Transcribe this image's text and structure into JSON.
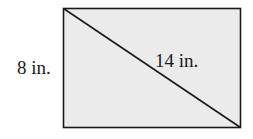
{
  "diagram": {
    "shape": "rectangle",
    "fill_color": "#ebebeb",
    "stroke_color": "#1a1a1a",
    "side_label": "8 in.",
    "diagonal_label": "14 in."
  }
}
